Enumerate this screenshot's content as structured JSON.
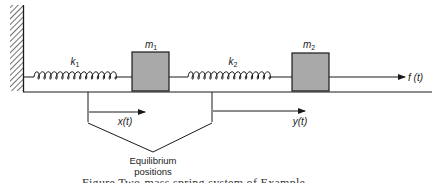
{
  "diagram": {
    "title": "Two-mass spring system",
    "masses": [
      {
        "id": "m1",
        "symbol": "m",
        "subscript": "1"
      },
      {
        "id": "m2",
        "symbol": "m",
        "subscript": "2"
      }
    ],
    "springs": [
      {
        "id": "k1",
        "symbol": "k",
        "subscript": "1"
      },
      {
        "id": "k2",
        "symbol": "k",
        "subscript": "2"
      }
    ],
    "force_label": "f (t)",
    "displacements": [
      {
        "id": "x",
        "label": "x(t)"
      },
      {
        "id": "y",
        "label": "y(t)"
      }
    ],
    "equilibrium_label_line1": "Equilibrium",
    "equilibrium_label_line2": "positions",
    "caption_partial": "Figure  Two-mass spring system of Example"
  },
  "colors": {
    "line": "#1a1a1a",
    "mass_fill": "#a9a9a9",
    "background": "#ffffff"
  }
}
